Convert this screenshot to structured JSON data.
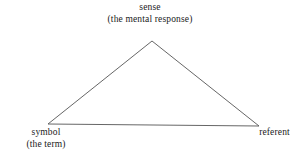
{
  "diagram": {
    "background_color": "#ffffff",
    "line_color": "#555555",
    "text_color": "#1a1a1a",
    "vertices": {
      "apex": {
        "name": "sense",
        "label_line_1": "sense",
        "label_line_2": "(the mental response)",
        "x": 152,
        "y": 41
      },
      "bottom_left": {
        "name": "symbol",
        "label_line_1": "symbol",
        "label_line_2": "(the term)",
        "x": 48,
        "y": 124
      },
      "bottom_right": {
        "name": "referent",
        "label_line_1": "referent",
        "label_line_2": "",
        "x": 259,
        "y": 126
      }
    },
    "edges": [
      {
        "name": "symbol-to-sense",
        "from": "bottom_left",
        "to": "apex"
      },
      {
        "name": "sense-to-referent",
        "from": "apex",
        "to": "bottom_right"
      },
      {
        "name": "symbol-to-referent",
        "from": "bottom_left",
        "to": "bottom_right"
      }
    ]
  }
}
